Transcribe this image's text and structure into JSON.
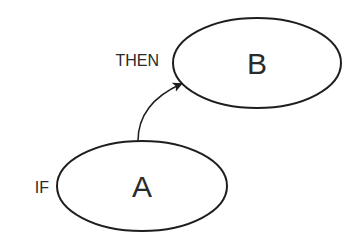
{
  "diagram": {
    "nodes": [
      {
        "id": "A",
        "label": "A",
        "side_label": "IF"
      },
      {
        "id": "B",
        "label": "B",
        "side_label": "THEN"
      }
    ],
    "edges": [
      {
        "from": "A",
        "to": "B",
        "style": "curved-arrow"
      }
    ],
    "colors": {
      "stroke": "#1e1e1e",
      "text": "#2a2a2a",
      "background": "#ffffff"
    }
  }
}
